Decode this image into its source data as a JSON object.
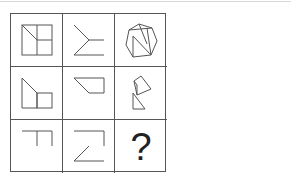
{
  "puzzle": {
    "type": "3x3 figure reasoning grid",
    "cells": [
      {
        "row": 1,
        "col": 1,
        "figure": "square divided into quadrants with diagonal in top-left"
      },
      {
        "row": 1,
        "col": 2,
        "figure": "arrow-like chevron with two horizontal lines"
      },
      {
        "row": 1,
        "col": 3,
        "figure": "heptagon with internal N-shaped lines"
      },
      {
        "row": 2,
        "col": 1,
        "figure": "trapezoid with attached square"
      },
      {
        "row": 2,
        "col": 2,
        "figure": "right trapezoid (slanted left side)"
      },
      {
        "row": 2,
        "col": 3,
        "figure": "flag-like shape with triangles"
      },
      {
        "row": 3,
        "col": 1,
        "figure": "T-shaped open lines"
      },
      {
        "row": 3,
        "col": 2,
        "figure": "Z-shaped open lines"
      },
      {
        "row": 3,
        "col": 3,
        "figure": "question mark"
      }
    ],
    "answer_placeholder": "?"
  },
  "colors": {
    "line": "#555555",
    "grid": "#555555",
    "background": "#ffffff"
  }
}
